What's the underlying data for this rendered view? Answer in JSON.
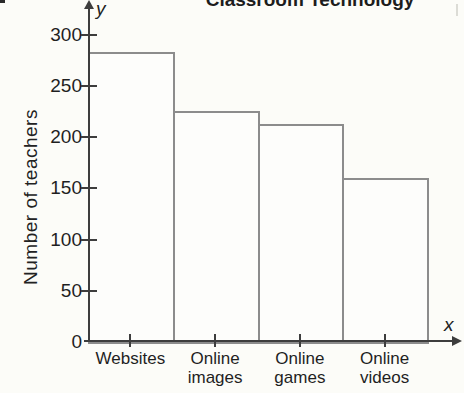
{
  "figure": {
    "y_axis_letter": "y",
    "x_axis_letter": "x"
  },
  "chart_data": {
    "type": "bar",
    "title": "Classroom Technology",
    "categories": [
      "Websites",
      "Online images",
      "Online games",
      "Online videos"
    ],
    "category_labels": [
      "Websites",
      "Online\nimages",
      "Online\ngames",
      "Online\nvideos"
    ],
    "values": [
      283,
      225,
      213,
      160
    ],
    "xlabel": "",
    "ylabel": "Number of teachers",
    "ylim": [
      0,
      300
    ],
    "yticks": [
      0,
      50,
      100,
      150,
      200,
      250,
      300
    ],
    "grid": false,
    "legend": false,
    "bars_touching": true,
    "bar_fill": "#fdfdfb",
    "bar_outline": "#8c8c8c",
    "axis_color": "#3d3d3d",
    "text_color": "#1f1f1f",
    "background_color": "#fcfcf8"
  }
}
